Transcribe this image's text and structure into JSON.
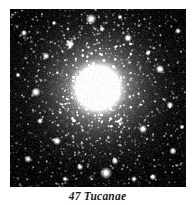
{
  "figure": {
    "kind": "astronomical-photograph",
    "background_color": "#ffffff",
    "caption": "47 Tucanae",
    "plate": {
      "background_color": "#000000",
      "x": 10,
      "y": 9,
      "width": 176,
      "height": 178
    }
  },
  "chart_data": {
    "type": "scatter",
    "title": "47 Tucanae",
    "subtitle": "",
    "xlabel": "",
    "ylabel": "",
    "grid": false,
    "legend": null,
    "background_color": "#000000",
    "star_color": "#ffffff",
    "field": {
      "x_range": [
        0,
        176
      ],
      "y_range": [
        0,
        178
      ],
      "units": "pixels"
    },
    "core": {
      "center_x": 88,
      "center_y": 79,
      "saturated_radius": 15,
      "bright_halo_radius": 30,
      "outer_halo_radius": 68,
      "peak_brightness": 255
    },
    "radial_profile": {
      "radius": [
        0,
        8,
        15,
        22,
        30,
        40,
        52,
        64,
        78,
        95,
        120
      ],
      "mean_brightness": [
        255,
        255,
        248,
        205,
        150,
        96,
        58,
        34,
        19,
        10,
        5
      ],
      "star_density_per_100px2": [
        95,
        92,
        82,
        66,
        50,
        34,
        22,
        14,
        9,
        5,
        3
      ]
    },
    "star_counts": {
      "total_rendered": 5200,
      "bright_field_stars": 26
    },
    "bright_stars": [
      {
        "x": 81,
        "y": 10,
        "size": 2.3
      },
      {
        "x": 96,
        "y": 164,
        "size": 2.6
      },
      {
        "x": 26,
        "y": 83,
        "size": 2.0
      },
      {
        "x": 150,
        "y": 60,
        "size": 1.9
      },
      {
        "x": 133,
        "y": 120,
        "size": 1.8
      },
      {
        "x": 47,
        "y": 132,
        "size": 1.8
      },
      {
        "x": 60,
        "y": 35,
        "size": 1.7
      },
      {
        "x": 118,
        "y": 29,
        "size": 1.7
      },
      {
        "x": 163,
        "y": 142,
        "size": 1.6
      },
      {
        "x": 18,
        "y": 150,
        "size": 1.6
      },
      {
        "x": 160,
        "y": 96,
        "size": 1.5
      },
      {
        "x": 36,
        "y": 47,
        "size": 1.5
      },
      {
        "x": 105,
        "y": 152,
        "size": 1.5
      },
      {
        "x": 70,
        "y": 158,
        "size": 1.4
      },
      {
        "x": 143,
        "y": 168,
        "size": 1.4
      },
      {
        "x": 14,
        "y": 24,
        "size": 1.4
      },
      {
        "x": 168,
        "y": 22,
        "size": 1.3
      },
      {
        "x": 124,
        "y": 170,
        "size": 1.3
      },
      {
        "x": 30,
        "y": 112,
        "size": 1.3
      },
      {
        "x": 92,
        "y": 20,
        "size": 1.2
      },
      {
        "x": 138,
        "y": 44,
        "size": 1.2
      },
      {
        "x": 55,
        "y": 170,
        "size": 1.2
      },
      {
        "x": 172,
        "y": 118,
        "size": 1.1
      },
      {
        "x": 8,
        "y": 66,
        "size": 1.1
      },
      {
        "x": 110,
        "y": 8,
        "size": 1.1
      },
      {
        "x": 44,
        "y": 14,
        "size": 1.0
      }
    ]
  }
}
